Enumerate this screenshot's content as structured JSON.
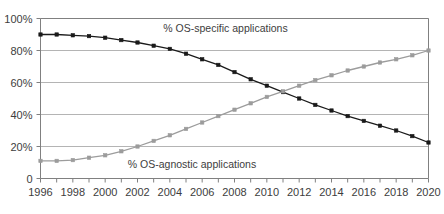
{
  "chart_data": {
    "type": "line",
    "title": "",
    "subtitle": "",
    "xlabel": "",
    "ylabel": "",
    "xlim": [
      1996,
      2020
    ],
    "ylim": [
      0,
      100
    ],
    "grid": true,
    "legend_position": "inline-annotations",
    "x": [
      1996,
      1997,
      1998,
      1999,
      2000,
      2001,
      2002,
      2003,
      2004,
      2005,
      2006,
      2007,
      2008,
      2009,
      2010,
      2011,
      2012,
      2013,
      2014,
      2015,
      2016,
      2017,
      2018,
      2019,
      2020
    ],
    "xtick_labels": [
      "1996",
      "1998",
      "2000",
      "2002",
      "2004",
      "2006",
      "2008",
      "2010",
      "2012",
      "2014",
      "2016",
      "2018",
      "2020"
    ],
    "xtick_values": [
      1996,
      1998,
      2000,
      2002,
      2004,
      2006,
      2008,
      2010,
      2012,
      2014,
      2016,
      2018,
      2020
    ],
    "ytick_labels": [
      "0",
      "20%",
      "40%",
      "60%",
      "80%",
      "100%"
    ],
    "ytick_values": [
      0,
      20,
      40,
      60,
      80,
      100
    ],
    "series": [
      {
        "name": "% OS-specific applications",
        "color": "#1a1a1a",
        "marker": "square",
        "values": [
          90,
          90,
          89.5,
          89,
          88,
          86.5,
          85,
          83,
          81,
          78,
          74.5,
          71,
          66.5,
          62,
          58,
          54,
          50,
          46,
          42.5,
          39,
          36,
          33,
          30,
          26.5,
          22.5
        ]
      },
      {
        "name": "% OS-agnostic applications",
        "color": "#9c9c9c",
        "marker": "square",
        "values": [
          11,
          11,
          11.5,
          13,
          14.5,
          17,
          20,
          23.5,
          27,
          31,
          35,
          39,
          43,
          47,
          51,
          54.5,
          58,
          61.5,
          64.5,
          67.5,
          70,
          72.5,
          74.5,
          77,
          80
        ]
      }
    ],
    "annotations": [
      {
        "text": "% OS-specific applications",
        "x": 2003.6,
        "y": 94
      },
      {
        "text": "% OS-agnostic applications",
        "x": 2001.4,
        "y": 9
      }
    ]
  },
  "colors": {
    "series_specific": "#1a1a1a",
    "series_agnostic": "#9c9c9c",
    "grid": "#b4b4b4",
    "axis": "#808080",
    "text": "#3d3d3d",
    "background": "#ffffff"
  }
}
